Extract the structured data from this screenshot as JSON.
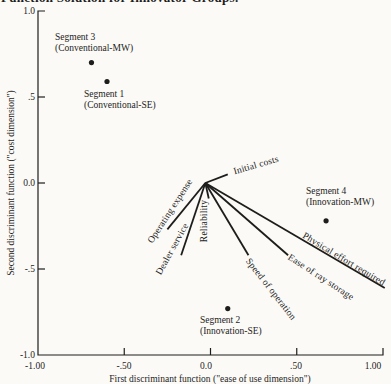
{
  "figure": {
    "title_clipped": "Function Solution for Innovator Groups."
  },
  "chart_data": {
    "type": "scatter",
    "title": "Function Solution for Innovator Groups.",
    "subtitle": "Discriminant map of four segments with attribute vectors radiating from the origin",
    "x_axis": {
      "label": "First discriminant function (\"ease of use dimension\")",
      "ticks": [
        "-1.00",
        "-.50",
        "0.0",
        ".50",
        "1.00"
      ],
      "tick_values": [
        -1,
        -0.5,
        0,
        0.5,
        1
      ],
      "range": [
        -1,
        1
      ]
    },
    "y_axis": {
      "label": "Second discriminant function (\"cost dimension\")",
      "ticks": [
        "1.0",
        ".5",
        "0.0",
        "-.5",
        "-1.0"
      ],
      "tick_values": [
        1,
        0.5,
        0,
        -0.5,
        -1
      ],
      "range": [
        -1,
        1
      ]
    },
    "grid": false,
    "legend": "none",
    "origin": {
      "x": -0.03,
      "y": 0.0
    },
    "points": [
      {
        "name": "Segment 3",
        "group": "(Conventional-MW)",
        "x": -0.69,
        "y": 0.7
      },
      {
        "name": "Segment 1",
        "group": "(Conventional-SE)",
        "x": -0.6,
        "y": 0.59
      },
      {
        "name": "Segment 4",
        "group": "(Innovation-MW)",
        "x": 0.67,
        "y": -0.22
      },
      {
        "name": "Segment 2",
        "group": "(Innovation-SE)",
        "x": 0.1,
        "y": -0.73
      }
    ],
    "vectors": [
      {
        "label": "Initial costs",
        "x": 0.1,
        "y": 0.05
      },
      {
        "label": "Operating expense",
        "x": -0.25,
        "y": -0.27
      },
      {
        "label": "Dealer service",
        "x": -0.17,
        "y": -0.42
      },
      {
        "label": "Reliability",
        "x": -0.01,
        "y": -0.09
      },
      {
        "label": "Speed of operation",
        "x": 0.22,
        "y": -0.42
      },
      {
        "label": "Ease of ray storage",
        "x": 0.45,
        "y": -0.42
      },
      {
        "label": "Physical effort required",
        "x": 1.01,
        "y": -0.61
      }
    ],
    "colors": {
      "ink": "#1d1d1b",
      "paper": "#fbfaf7"
    }
  }
}
